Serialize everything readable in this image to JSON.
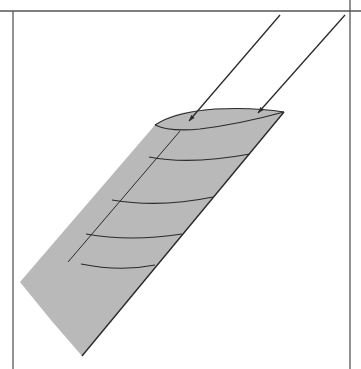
{
  "figure": {
    "colors": {
      "background": "#ffffff",
      "wing_fill": "#b9b9b9",
      "line": "#2a2a2a",
      "frame": "#555555"
    },
    "frame": {
      "top_y": 11,
      "left_x": 13,
      "right_x": 350
    },
    "wing": {
      "outline": "M155,125 L20,282 Q50,320 82,356 L284,112 Q250,108 210,109 Q170,112 155,125 Z",
      "airfoil_top": "M155,125 Q175,112 215,109 Q255,107 284,112",
      "airfoil_bottom": "M155,125 Q170,132 200,129 Q240,124 284,112",
      "leading_edge_line": "M180,131 L68,262",
      "trailing_edge_line": "M284,112 L82,356"
    },
    "chord_lines": [
      "M149,157 Q190,165 250,154",
      "M112,200 Q160,208 213,197",
      "M86,234 Q130,242 182,234",
      "M81,264 Q120,272 155,265"
    ],
    "arrows": [
      {
        "x1": 280,
        "y1": 15,
        "x2": 189,
        "y2": 121
      },
      {
        "x1": 345,
        "y1": 15,
        "x2": 258,
        "y2": 113
      }
    ]
  }
}
